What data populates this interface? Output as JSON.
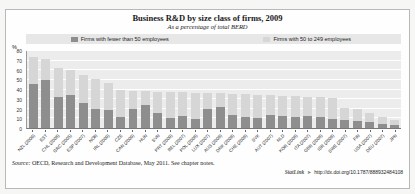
{
  "figure": {
    "title": "Business R&D by size class of firms, 2009",
    "subtitle": "As a percentage of total BERD",
    "percent_label": "%",
    "source_prefix": "Source:",
    "source_text": " OECD, Research and Development Database, May 2011. See chapter notes.",
    "statlink_label": "StatLink",
    "statlink_icon": "➤",
    "statlink_url": "http://dx.doi.org/10.1787/888932484108"
  },
  "colors": {
    "series_small": "#8e8e8e",
    "series_medium": "#d6d6d6",
    "plot_background": "#ececec",
    "legend_band": "#e7e7e7"
  },
  "chart_data": {
    "type": "bar",
    "stacked": true,
    "title": "Business R&D by size class of firms, 2009",
    "subtitle": "As a percentage of total BERD",
    "ylabel": "%",
    "ylim": [
      0,
      80
    ],
    "yticks": [
      0,
      10,
      20,
      30,
      40,
      50,
      60,
      70,
      80
    ],
    "grid": true,
    "legend_position": "top",
    "categories": [
      "NZL (2009)",
      "EST",
      "CHL (2008)",
      "GRC (2005)",
      "ESP (2007)",
      "NOR",
      "IRL (2009)",
      "CZE",
      "CAN (2009)",
      "HUN",
      "SVN",
      "PRT (2009)",
      "BEL (2007)",
      "POL (2008)",
      "LUX (2007)",
      "AUS (2008)",
      "DNK (2008)",
      "CHE (2008)",
      "SVK",
      "AUT (2007)",
      "NLD",
      "KOR (2008)",
      "ITA (2007)",
      "GBR (2008)",
      "ISR (2008)",
      "SWE (2007)",
      "FIN",
      "USA (2007)",
      "DEU (2007)",
      "JPN"
    ],
    "series": [
      {
        "name": "Firms with fewer than 50 employees",
        "color": "#8e8e8e",
        "values": [
          45.5,
          49.5,
          31.5,
          33.5,
          26,
          19.5,
          18.5,
          11.5,
          19.5,
          24,
          15.5,
          10.5,
          12.5,
          9.5,
          19.5,
          22,
          13.5,
          11,
          10,
          13,
          12,
          11.5,
          12,
          11,
          9,
          8,
          7.5,
          6.5,
          4.5,
          3.5
        ]
      },
      {
        "name": "Firms with 50 to 249 employees",
        "color": "#d6d6d6",
        "values": [
          27.5,
          21,
          30.5,
          25.5,
          28,
          30.5,
          27.5,
          27.5,
          18.5,
          13.5,
          21.5,
          26.5,
          24,
          26.5,
          16.5,
          13.5,
          21.5,
          23.5,
          24,
          20.5,
          21,
          21,
          20,
          20.5,
          22,
          13,
          11.5,
          8.5,
          6.5,
          4.5
        ]
      }
    ]
  }
}
